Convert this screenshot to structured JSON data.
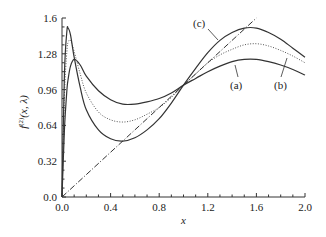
{
  "chart_data": {
    "type": "line",
    "title": "",
    "xlabel": "x",
    "ylabel": "f^(2)(x, λ)",
    "xlim": [
      0.0,
      2.0
    ],
    "ylim": [
      0.0,
      1.6
    ],
    "x_ticks": [
      "0.0",
      "0.4",
      "0.8",
      "1.2",
      "1.6",
      "2.0"
    ],
    "y_ticks": [
      "0.0",
      "0.32",
      "0.64",
      "0.96",
      "1.28",
      "1.6"
    ],
    "grid": false,
    "legend": "inline annotations with arrows",
    "x": [
      0,
      0.02,
      0.04,
      0.05,
      0.07,
      0.1,
      0.15,
      0.2,
      0.3,
      0.4,
      0.5,
      0.6,
      0.7,
      0.8,
      0.9,
      1.0,
      1.1,
      1.2,
      1.3,
      1.4,
      1.5,
      1.6,
      1.7,
      1.8,
      1.9,
      2.0
    ],
    "series": [
      {
        "name": "(a)",
        "style": "solid",
        "values": [
          0,
          0.6,
          0.95,
          1.05,
          1.17,
          1.23,
          1.18,
          1.08,
          0.95,
          0.87,
          0.83,
          0.83,
          0.85,
          0.88,
          0.93,
          1.0,
          1.06,
          1.12,
          1.17,
          1.21,
          1.23,
          1.23,
          1.21,
          1.18,
          1.14,
          1.09
        ]
      },
      {
        "name": "(b)",
        "style": "dotted",
        "values": [
          0,
          0.9,
          1.3,
          1.38,
          1.4,
          1.3,
          1.1,
          0.93,
          0.76,
          0.69,
          0.67,
          0.69,
          0.74,
          0.8,
          0.89,
          1.0,
          1.1,
          1.2,
          1.27,
          1.32,
          1.36,
          1.37,
          1.35,
          1.31,
          1.26,
          1.2
        ]
      },
      {
        "name": "(c)",
        "style": "solid",
        "values": [
          0,
          1.1,
          1.48,
          1.51,
          1.45,
          1.25,
          0.98,
          0.78,
          0.6,
          0.52,
          0.5,
          0.53,
          0.6,
          0.7,
          0.84,
          1.0,
          1.15,
          1.29,
          1.4,
          1.47,
          1.51,
          1.51,
          1.47,
          1.41,
          1.33,
          1.25
        ]
      },
      {
        "name": "reference y = x",
        "style": "dash-dot",
        "x": [
          0,
          1.6
        ],
        "values": [
          0,
          1.6
        ]
      }
    ],
    "annotations": [
      {
        "text": "(a)",
        "pos": [
          1.45,
          0.98
        ],
        "arrow_to": [
          1.4,
          1.2
        ]
      },
      {
        "text": "(b)",
        "pos": [
          1.8,
          0.98
        ],
        "arrow_to": [
          1.8,
          1.3
        ]
      },
      {
        "text": "(c)",
        "pos": [
          1.15,
          1.55
        ],
        "arrow_to": [
          1.3,
          1.4
        ]
      }
    ]
  },
  "labels": {
    "xlabel": "x",
    "ylabel_main": "f",
    "ylabel_sup": "(2)",
    "ylabel_args": "(x, λ)",
    "annot_a": "(a)",
    "annot_b": "(b)",
    "annot_c": "(c)"
  }
}
